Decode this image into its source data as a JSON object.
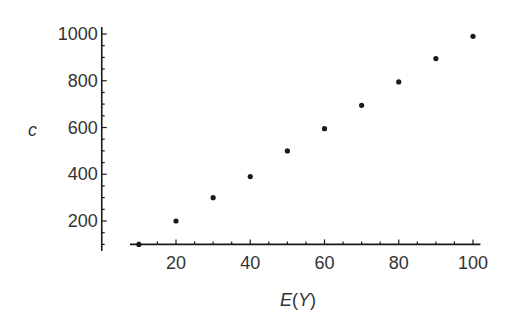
{
  "chart_data": {
    "type": "scatter",
    "title": "",
    "xlabel": "E(Y)",
    "ylabel": "c",
    "x": [
      10,
      20,
      30,
      40,
      50,
      60,
      70,
      80,
      90,
      100
    ],
    "y": [
      100,
      200,
      300,
      390,
      500,
      595,
      695,
      795,
      895,
      990
    ],
    "series": [
      {
        "name": "c vs E(Y)",
        "x": [
          10,
          20,
          30,
          40,
          50,
          60,
          70,
          80,
          90,
          100
        ],
        "values": [
          100,
          200,
          300,
          390,
          500,
          595,
          695,
          795,
          895,
          990
        ]
      }
    ],
    "xticks": [
      20,
      40,
      60,
      80,
      100
    ],
    "yticks": [
      200,
      400,
      600,
      800,
      1000
    ],
    "xlim": [
      7.6,
      102
    ],
    "ylim": [
      72,
      1030
    ],
    "x_axis_crosses_at_y": 100,
    "y_axis_crosses_at_x": 0,
    "minor_ticks": {
      "x_step": 5,
      "y_step": 50
    },
    "grid": false,
    "legend": null,
    "marker_color": "#1a1a1a",
    "axis_color": "#1a1a1a"
  },
  "labels": {
    "xlabel_E": "E",
    "xlabel_open": "(",
    "xlabel_Y": "Y",
    "xlabel_close": ")",
    "ylabel": "c"
  }
}
